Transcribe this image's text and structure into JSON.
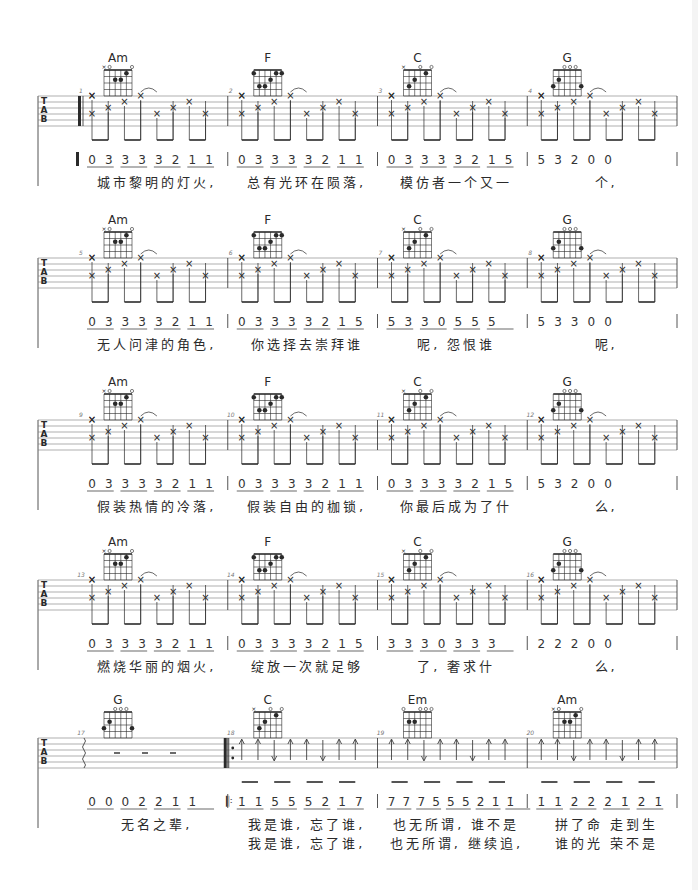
{
  "sheet": {
    "type": "guitar-tab-with-numbered-notation",
    "systems": [
      {
        "top": 50,
        "bars": [
          {
            "number": "1",
            "chord": "Am",
            "notation": [
              "0",
              "3",
              "3",
              "3",
              "3",
              "2",
              "1",
              "1"
            ],
            "start_repeat": false,
            "thick_start": true,
            "lyrics": [
              "城市黎明的灯火,"
            ]
          },
          {
            "number": "2",
            "chord": "F",
            "notation": [
              "0",
              "3",
              "3",
              "3",
              "3",
              "2",
              "1",
              "1"
            ],
            "lyrics": [
              "总有光环在陨落,"
            ]
          },
          {
            "number": "3",
            "chord": "C",
            "notation": [
              "0",
              "3",
              "3",
              "3",
              "3",
              "2",
              "1",
              "5"
            ],
            "lyrics": [
              "模仿者一个又一"
            ]
          },
          {
            "number": "4",
            "chord": "G",
            "notation": [
              "5",
              "3",
              "2",
              "0",
              "0"
            ],
            "lyrics": [
              "个,"
            ]
          }
        ]
      },
      {
        "top": 212,
        "bars": [
          {
            "number": "5",
            "chord": "Am",
            "notation": [
              "0",
              "3",
              "3",
              "3",
              "3",
              "2",
              "1",
              "1"
            ],
            "lyrics": [
              "无人问津的角色,"
            ]
          },
          {
            "number": "6",
            "chord": "F",
            "notation": [
              "0",
              "3",
              "3",
              "3",
              "3",
              "2",
              "1",
              "5"
            ],
            "lyrics": [
              "你选择去崇拜谁"
            ]
          },
          {
            "number": "7",
            "chord": "C",
            "notation": [
              "5",
              "3",
              "3",
              "0",
              "5",
              "5",
              "5"
            ],
            "lyrics": [
              "呢,",
              "怨恨谁"
            ]
          },
          {
            "number": "8",
            "chord": "G",
            "notation": [
              "5",
              "3",
              "3",
              "0",
              "0"
            ],
            "lyrics": [
              "呢,"
            ]
          }
        ]
      },
      {
        "top": 374,
        "bars": [
          {
            "number": "9",
            "chord": "Am",
            "notation": [
              "0",
              "3",
              "3",
              "3",
              "3",
              "2",
              "1",
              "1"
            ],
            "lyrics": [
              "假装热情的冷落,"
            ]
          },
          {
            "number": "10",
            "chord": "F",
            "notation": [
              "0",
              "3",
              "3",
              "3",
              "3",
              "2",
              "1",
              "1"
            ],
            "lyrics": [
              "假装自由的枷锁,"
            ]
          },
          {
            "number": "11",
            "chord": "C",
            "notation": [
              "0",
              "3",
              "3",
              "3",
              "3",
              "2",
              "1",
              "5"
            ],
            "lyrics": [
              "你最后成为了什"
            ]
          },
          {
            "number": "12",
            "chord": "G",
            "notation": [
              "5",
              "3",
              "2",
              "0",
              "0"
            ],
            "lyrics": [
              "么,"
            ]
          }
        ]
      },
      {
        "top": 534,
        "bars": [
          {
            "number": "13",
            "chord": "Am",
            "notation": [
              "0",
              "3",
              "3",
              "3",
              "3",
              "2",
              "1",
              "1"
            ],
            "lyrics": [
              "燃烧华丽的烟火,"
            ]
          },
          {
            "number": "14",
            "chord": "F",
            "notation": [
              "0",
              "3",
              "3",
              "3",
              "3",
              "2",
              "1",
              "5"
            ],
            "lyrics": [
              "绽放一次就足够"
            ]
          },
          {
            "number": "15",
            "chord": "C",
            "notation": [
              "3",
              "3",
              "3",
              "0",
              "3",
              "3",
              "3"
            ],
            "lyrics": [
              "了,",
              "奢求什"
            ]
          },
          {
            "number": "16",
            "chord": "G",
            "notation": [
              "2",
              "2",
              "2",
              "0",
              "0"
            ],
            "lyrics": [
              "么,"
            ]
          }
        ]
      },
      {
        "top": 692,
        "bars": [
          {
            "number": "17",
            "chord": "G",
            "notation": [
              "0",
              "0",
              "0",
              "2̇",
              "2̇",
              "1̇",
              "1̇"
            ],
            "lyrics": [
              "无名之辈,"
            ]
          },
          {
            "number": "18",
            "chord": "C",
            "notation": [
              "1̇",
              "1̇",
              "5",
              "5",
              "5",
              "2̇",
              "1̇",
              "7"
            ],
            "start_repeat": true,
            "lyrics": [
              "我是谁,",
              "忘了谁,"
            ],
            "lyrics2": [
              "我是谁,",
              "忘了谁,"
            ]
          },
          {
            "number": "19",
            "chord": "Em",
            "notation": [
              "7",
              "7",
              "7",
              "5",
              "5",
              "5",
              "2̇",
              "1̇",
              "1̇"
            ],
            "lyrics": [
              "也无所谓,",
              "谁不是"
            ],
            "lyrics2": [
              "也无所谓,",
              "继续追,"
            ]
          },
          {
            "number": "20",
            "chord": "Am",
            "notation": [
              "1̇",
              "1̇",
              "2̇",
              "2̇",
              "2̇",
              "1̇",
              "2̇",
              "1̇"
            ],
            "lyrics": [
              "拼了命",
              "走到生"
            ],
            "lyrics2": [
              "谁的光",
              "荣不是"
            ]
          }
        ]
      }
    ],
    "tab_letters": [
      "T",
      "A",
      "B"
    ],
    "colors": {
      "ink": "#2a2a2a",
      "staff": "#7a7a7a",
      "background": "#ffffff"
    }
  }
}
